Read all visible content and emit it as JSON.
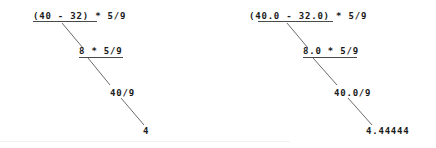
{
  "figure": {
    "background_color": "#ffffff",
    "text_color": "#1a1a1a",
    "rule_color": "#4a4a4a",
    "connector_color": "#6b6b6b"
  },
  "trees": [
    {
      "id": "integer-division-tree",
      "name": "integer-arithmetic-tree",
      "steps": [
        {
          "label": "(40 - 32) * 5/9",
          "name": "step-1"
        },
        {
          "label": "8 * 5/9",
          "name": "step-2"
        },
        {
          "label": "40/9",
          "name": "step-3"
        },
        {
          "label": "4",
          "name": "step-4-result"
        }
      ]
    },
    {
      "id": "float-division-tree",
      "name": "float-arithmetic-tree",
      "steps": [
        {
          "label": "(40.0 - 32.0) * 5/9",
          "name": "step-1"
        },
        {
          "label": "8.0 * 5/9",
          "name": "step-2"
        },
        {
          "label": "40.0/9",
          "name": "step-3"
        },
        {
          "label": "4.44444",
          "name": "step-4-result"
        }
      ]
    }
  ]
}
